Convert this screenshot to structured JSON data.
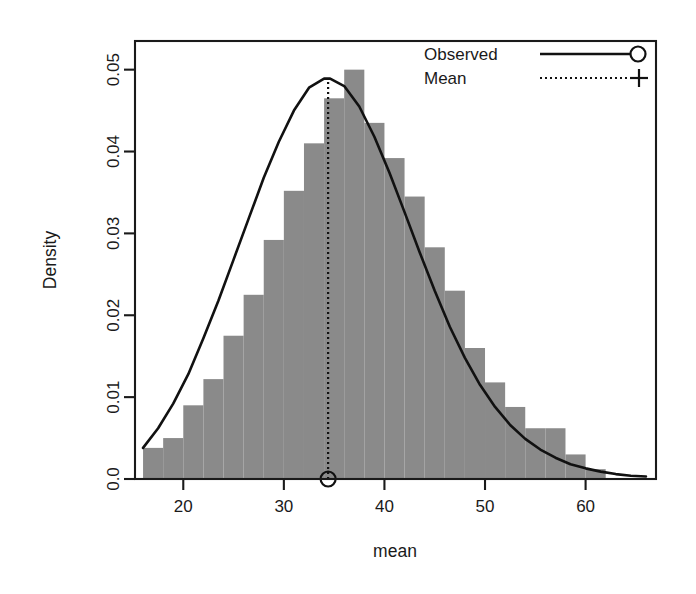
{
  "chart_data": {
    "type": "bar",
    "title": "",
    "subtitle": "",
    "xlabel": "mean",
    "ylabel": "Density",
    "xlim": [
      15.2,
      67.0
    ],
    "ylim": [
      0.0,
      0.0535
    ],
    "grid": false,
    "legend_position": "top-right",
    "xticks": [
      20,
      30,
      40,
      50,
      60
    ],
    "xtick_labels": [
      "20",
      "30",
      "40",
      "50",
      "60"
    ],
    "yticks": [
      0.0,
      0.01,
      0.02,
      0.03,
      0.04,
      0.05
    ],
    "ytick_labels": [
      "0.0",
      "0.01",
      "0.02",
      "0.03",
      "0.04",
      "0.05"
    ],
    "bar_color": "#8a8a8a",
    "line_color": "#111111",
    "bin_width": 2,
    "bin_edges": [
      16,
      18,
      20,
      22,
      24,
      26,
      28,
      30,
      32,
      34,
      36,
      38,
      40,
      42,
      44,
      46,
      48,
      50,
      52,
      54,
      56,
      58,
      60,
      62
    ],
    "categories": [
      "16-18",
      "18-20",
      "20-22",
      "22-24",
      "24-26",
      "26-28",
      "28-30",
      "30-32",
      "32-34",
      "34-36",
      "36-38",
      "38-40",
      "40-42",
      "42-44",
      "44-46",
      "46-48",
      "48-50",
      "50-52",
      "52-54",
      "54-56",
      "56-58",
      "58-60",
      "60-62"
    ],
    "values": [
      0.0038,
      0.005,
      0.009,
      0.0122,
      0.0175,
      0.0225,
      0.0292,
      0.0352,
      0.041,
      0.0465,
      0.05,
      0.0435,
      0.0392,
      0.0345,
      0.0283,
      0.023,
      0.016,
      0.0118,
      0.0088,
      0.0062,
      0.0062,
      0.003,
      0.0012
    ],
    "series": [
      {
        "name": "Observed",
        "type": "line",
        "x": [
          16.0,
          17.5,
          19.0,
          20.5,
          22.0,
          23.5,
          25.0,
          26.5,
          28.0,
          29.5,
          31.0,
          32.5,
          34.0,
          34.6,
          36.0,
          37.5,
          39.0,
          40.5,
          42.0,
          43.5,
          45.0,
          46.5,
          48.0,
          49.5,
          51.0,
          52.5,
          54.0,
          55.5,
          57.0,
          58.5,
          60.0,
          61.5,
          63.0,
          64.5,
          66.0
        ],
        "y": [
          0.0038,
          0.0062,
          0.0092,
          0.0128,
          0.0172,
          0.0218,
          0.0268,
          0.0318,
          0.0368,
          0.0412,
          0.045,
          0.0478,
          0.0489,
          0.0489,
          0.048,
          0.0455,
          0.0418,
          0.0374,
          0.0326,
          0.0277,
          0.023,
          0.0186,
          0.0148,
          0.0115,
          0.0088,
          0.0066,
          0.0049,
          0.0036,
          0.0026,
          0.0018,
          0.0013,
          0.0009,
          0.0006,
          0.0004,
          0.0003
        ]
      },
      {
        "name": "Mean",
        "type": "vline",
        "value": 34.4
      }
    ],
    "mean_value": 34.4,
    "annotations": []
  },
  "legend": {
    "items": [
      {
        "label": "Observed",
        "style": "solid-line",
        "marker": "circle"
      },
      {
        "label": "Mean",
        "style": "dotted-line",
        "marker": "plus"
      }
    ]
  }
}
